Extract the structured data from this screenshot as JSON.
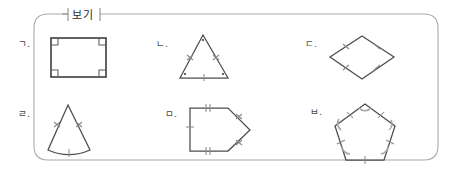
{
  "worksheet": {
    "legend_label": "보기",
    "caption": "",
    "stroke_color": "#4c4c4c",
    "mark_color": "#8a8a8a",
    "frame_color": "#a9a9a9"
  },
  "items": [
    {
      "id": "item-a",
      "label": "ㄱ.",
      "shape_name": "rectangle",
      "marks": "four right-angle squares at corners"
    },
    {
      "id": "item-b",
      "label": "ㄴ.",
      "shape_name": "isosceles-triangle",
      "marks": "double ticks on two legs, single tick on base, vertex dots"
    },
    {
      "id": "item-c",
      "label": "ㄷ.",
      "shape_name": "rhombus",
      "marks": "single tick on each of four sides"
    },
    {
      "id": "item-d",
      "label": "ㄹ.",
      "shape_name": "circular-sector",
      "marks": "double ticks on two radii, single tick on arc"
    },
    {
      "id": "item-e",
      "label": "ㅁ.",
      "shape_name": "right-pointing-pentagon",
      "marks": "single tick on left side, double ticks top and bottom, cross ticks on slanted sides"
    },
    {
      "id": "item-f",
      "label": "ㅂ.",
      "shape_name": "regular-pentagon",
      "marks": "ticks on all five sides, angle arcs at all five vertices"
    }
  ]
}
